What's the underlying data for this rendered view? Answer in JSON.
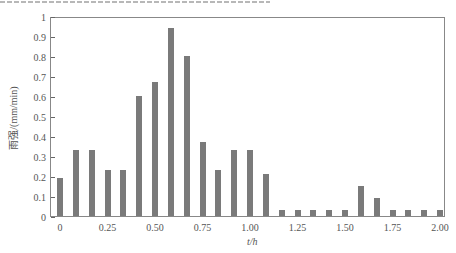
{
  "chart_data": {
    "type": "bar",
    "title": "",
    "xlabel": "t/h",
    "ylabel": "雨强/(mm/min)",
    "ylim": [
      0,
      1
    ],
    "xlim": [
      0,
      2.0
    ],
    "grid": false,
    "x_tick_labels": [
      "0",
      "0.25",
      "0.50",
      "0.75",
      "1.00",
      "1.25",
      "1.50",
      "1.75",
      "2.00"
    ],
    "y_tick_labels": [
      "0",
      "0.1",
      "0.2",
      "0.3",
      "0.4",
      "0.5",
      "0.6",
      "0.7",
      "0.8",
      "0.9",
      "1"
    ],
    "x": [
      0,
      0.083,
      0.167,
      0.25,
      0.333,
      0.417,
      0.5,
      0.583,
      0.667,
      0.75,
      0.833,
      0.917,
      1.0,
      1.083,
      1.167,
      1.25,
      1.333,
      1.417,
      1.5,
      1.583,
      1.667,
      1.75,
      1.833,
      1.917,
      2.0
    ],
    "values": [
      0.19,
      0.33,
      0.33,
      0.23,
      0.23,
      0.6,
      0.67,
      0.94,
      0.8,
      0.37,
      0.23,
      0.33,
      0.33,
      0.21,
      0.03,
      0.03,
      0.03,
      0.03,
      0.03,
      0.15,
      0.09,
      0.03,
      0.03,
      0.03,
      0.03
    ],
    "bar_color": "#7a7a7a"
  }
}
